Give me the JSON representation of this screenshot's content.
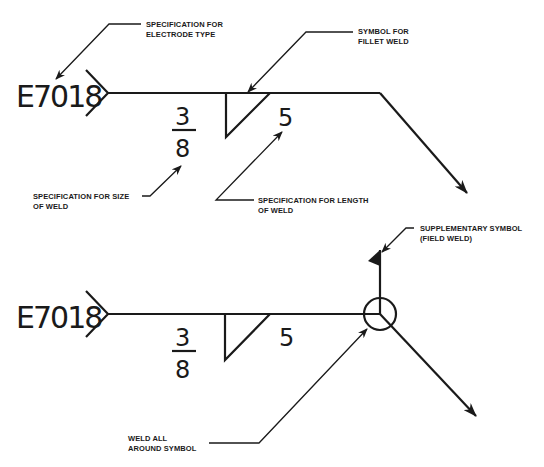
{
  "diagram": {
    "top_symbol": {
      "electrode": "E7018",
      "size_numerator": "3",
      "size_denominator": "8",
      "length": "5",
      "labels": {
        "electrode_spec": [
          "SPECIFICATION FOR",
          "ELECTRODE TYPE"
        ],
        "fillet_symbol": [
          "SYMBOL FOR",
          "FILLET WELD"
        ],
        "size_spec": [
          "SPECIFICATION FOR SIZE",
          "OF WELD"
        ],
        "length_spec": [
          "SPECIFICATION FOR LENGTH",
          "OF WELD"
        ]
      }
    },
    "bottom_symbol": {
      "electrode": "E7018",
      "size_numerator": "3",
      "size_denominator": "8",
      "length": "5",
      "labels": {
        "supplementary": [
          "SUPPLEMENTARY SYMBOL",
          "(FIELD WELD)"
        ],
        "weld_all_around": [
          "WELD ALL",
          "AROUND SYMBOL"
        ]
      }
    },
    "colors": {
      "ink": "#1a1a1a",
      "background": "#ffffff"
    }
  }
}
